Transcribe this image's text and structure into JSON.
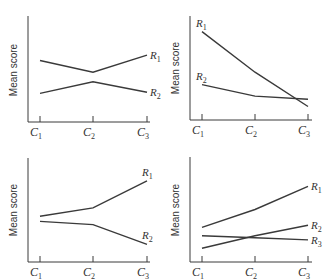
{
  "chart_data": [
    {
      "type": "line",
      "title": "",
      "xlabel": "",
      "ylabel": "Mean score",
      "ylim": [
        0,
        10
      ],
      "categories": [
        {
          "base": "C",
          "sub": "1"
        },
        {
          "base": "C",
          "sub": "2"
        },
        {
          "base": "C",
          "sub": "3"
        }
      ],
      "series": [
        {
          "name": {
            "base": "R",
            "sub": "1"
          },
          "values": [
            5.8,
            4.7,
            6.3
          ],
          "label_pos": "right"
        },
        {
          "name": {
            "base": "R",
            "sub": "2"
          },
          "values": [
            2.7,
            3.8,
            2.8
          ],
          "label_pos": "right"
        }
      ]
    },
    {
      "type": "line",
      "title": "",
      "xlabel": "",
      "ylabel": "Mean score",
      "ylim": [
        0,
        10
      ],
      "categories": [
        {
          "base": "C",
          "sub": "1"
        },
        {
          "base": "C",
          "sub": "2"
        },
        {
          "base": "C",
          "sub": "3"
        }
      ],
      "series": [
        {
          "name": {
            "base": "R",
            "sub": "1"
          },
          "values": [
            8.5,
            4.6,
            1.3
          ],
          "label_pos": "above-start"
        },
        {
          "name": {
            "base": "R",
            "sub": "2"
          },
          "values": [
            3.4,
            2.3,
            2.0
          ],
          "label_pos": "above-start"
        }
      ]
    },
    {
      "type": "line",
      "title": "",
      "xlabel": "",
      "ylabel": "Mean score",
      "ylim": [
        0,
        10
      ],
      "categories": [
        {
          "base": "C",
          "sub": "1"
        },
        {
          "base": "C",
          "sub": "2"
        },
        {
          "base": "C",
          "sub": "3"
        }
      ],
      "series": [
        {
          "name": {
            "base": "R",
            "sub": "1"
          },
          "values": [
            4.4,
            5.2,
            7.8
          ],
          "label_pos": "above-end"
        },
        {
          "name": {
            "base": "R",
            "sub": "2"
          },
          "values": [
            3.9,
            3.6,
            1.7
          ],
          "label_pos": "above-end"
        }
      ]
    },
    {
      "type": "line",
      "title": "",
      "xlabel": "",
      "ylabel": "Mean score",
      "ylim": [
        0,
        10
      ],
      "categories": [
        {
          "base": "C",
          "sub": "1"
        },
        {
          "base": "C",
          "sub": "2"
        },
        {
          "base": "C",
          "sub": "3"
        }
      ],
      "series": [
        {
          "name": {
            "base": "R",
            "sub": "1"
          },
          "values": [
            3.3,
            5.0,
            7.2
          ],
          "label_pos": "right"
        },
        {
          "name": {
            "base": "R",
            "sub": "2"
          },
          "values": [
            1.3,
            2.5,
            3.5
          ],
          "label_pos": "right"
        },
        {
          "name": {
            "base": "R",
            "sub": "3"
          },
          "values": [
            2.5,
            2.3,
            2.1
          ],
          "label_pos": "right"
        }
      ]
    }
  ]
}
